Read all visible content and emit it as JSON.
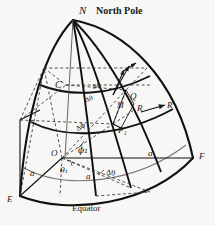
{
  "figure": {
    "title": "North Pole",
    "pole_label": "N",
    "equator_label": "Equator",
    "colors": {
      "background": "#f7f7f5",
      "ink": "#1a1a1a",
      "dashed": "#3a3a3a"
    },
    "labels": [
      {
        "id": "pole-N",
        "text": "N",
        "x": 79,
        "y": 5,
        "size": 11,
        "style": "italic"
      },
      {
        "id": "north-pole",
        "text": "North Pole",
        "x": 95,
        "y": 6,
        "size": 10,
        "style": "roman"
      },
      {
        "id": "point-C",
        "text": "C",
        "x": 55,
        "y": 83,
        "size": 10,
        "style": "italic"
      },
      {
        "id": "point-Q",
        "text": "Q",
        "x": 130,
        "y": 95,
        "size": 9,
        "style": "italic"
      },
      {
        "id": "point-M",
        "text": "M",
        "x": 118,
        "y": 105,
        "size": 8,
        "style": "italic"
      },
      {
        "id": "point-R",
        "text": "R",
        "x": 137,
        "y": 107,
        "size": 9,
        "style": "italic"
      },
      {
        "id": "point-Rprime",
        "text": "R′",
        "x": 167,
        "y": 110,
        "size": 9,
        "style": "italic"
      },
      {
        "id": "point-P1",
        "text": "P₁",
        "x": 119,
        "y": 131,
        "size": 9,
        "style": "italic"
      },
      {
        "id": "origin-O",
        "text": "O",
        "x": 52,
        "y": 152,
        "size": 9,
        "style": "italic"
      },
      {
        "id": "point-F",
        "text": "F",
        "x": 198,
        "y": 157,
        "size": 9,
        "style": "italic"
      },
      {
        "id": "point-E",
        "text": "E",
        "x": 8,
        "y": 200,
        "size": 9,
        "style": "italic"
      },
      {
        "id": "equator",
        "text": "Equator",
        "x": 72,
        "y": 206,
        "size": 9,
        "style": "roman"
      },
      {
        "id": "phi-one",
        "text": "ϕ₁",
        "x": 78,
        "y": 150,
        "size": 9,
        "style": "greek"
      },
      {
        "id": "theta-one",
        "text": "θ₁",
        "x": 61,
        "y": 171,
        "size": 8,
        "style": "greek"
      },
      {
        "id": "delta-phi",
        "text": "Δϕ",
        "x": 79,
        "y": 127,
        "size": 7,
        "style": "greek"
      },
      {
        "id": "delta-theta",
        "text": "Δθ",
        "x": 108,
        "y": 173,
        "size": 7,
        "style": "greek"
      },
      {
        "id": "delta-phi-2",
        "text": "Δϕ",
        "x": 93,
        "y": 86,
        "size": 6,
        "style": "greek"
      },
      {
        "id": "delta-theta-2",
        "text": "Δθ",
        "x": 86,
        "y": 99,
        "size": 6,
        "style": "greek"
      },
      {
        "id": "radius-a-left",
        "text": "a",
        "x": 30,
        "y": 173,
        "size": 9,
        "style": "italic"
      },
      {
        "id": "radius-a-bottom",
        "text": "a",
        "x": 86,
        "y": 176,
        "size": 9,
        "style": "italic"
      },
      {
        "id": "radius-a-right",
        "text": "a",
        "x": 148,
        "y": 153,
        "size": 9,
        "style": "italic"
      }
    ],
    "geometry": {
      "pole": {
        "x": 73,
        "y": 20
      },
      "origin": {
        "x": 62,
        "y": 158
      },
      "east": {
        "x": 20,
        "y": 196
      },
      "front": {
        "x": 193,
        "y": 158
      },
      "p1": {
        "x": 113,
        "y": 124
      },
      "q": {
        "x": 126,
        "y": 90
      },
      "c": {
        "x": 66,
        "y": 85
      }
    },
    "elements": {
      "meridians": 4,
      "parallels": 3,
      "dashed_construction_lines": true,
      "arrow_vectors": [
        "R-prime",
        "normal-at-Q"
      ]
    }
  }
}
